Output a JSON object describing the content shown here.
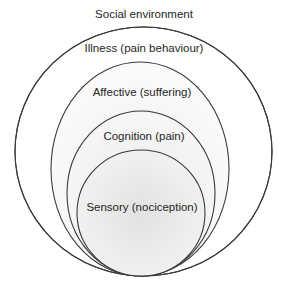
{
  "diagram": {
    "title": "Social environment",
    "layers": [
      {
        "label": "Illness (pain behaviour)",
        "level": 1
      },
      {
        "label": "Affective (suffering)",
        "level": 2
      },
      {
        "label": "Cognition (pain)",
        "level": 3
      },
      {
        "label": "Sensory (nociception)",
        "level": 4
      }
    ],
    "colors": {
      "stroke": "#3a3a3a",
      "text": "#262626",
      "fill_outer": "#fbfbfb",
      "fill_inner": "#e4e4e4"
    }
  }
}
